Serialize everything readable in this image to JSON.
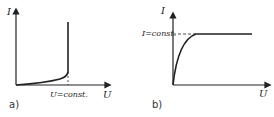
{
  "panels": [
    {
      "id": "a",
      "caption": "a)",
      "y_axis_label": "I",
      "x_axis_label": "U",
      "marker_label": "U=const.",
      "curve": "current rises slowly with voltage, then shoots vertically at constant voltage"
    },
    {
      "id": "b",
      "caption": "b)",
      "y_axis_label": "I",
      "x_axis_label": "U",
      "marker_label": "I=const.",
      "curve": "current rises steeply then saturates at constant current"
    }
  ],
  "colors": {
    "line": "#222222",
    "background": "#ffffff"
  }
}
